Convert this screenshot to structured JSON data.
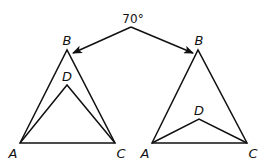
{
  "diagram": {
    "angle_label": "70°",
    "left_figure": {
      "points": {
        "A": {
          "label": "A",
          "x": 20,
          "y": 143
        },
        "B": {
          "label": "B",
          "x": 67,
          "y": 50
        },
        "C": {
          "label": "C",
          "x": 115,
          "y": 143
        },
        "D": {
          "label": "D",
          "x": 67,
          "y": 85
        }
      }
    },
    "right_figure": {
      "points": {
        "A": {
          "label": "A",
          "x": 152,
          "y": 143
        },
        "B": {
          "label": "B",
          "x": 198,
          "y": 50
        },
        "C": {
          "label": "C",
          "x": 247,
          "y": 143
        },
        "D": {
          "label": "D",
          "x": 199,
          "y": 119
        }
      }
    },
    "arrows": {
      "origin": {
        "x": 131,
        "y": 27
      },
      "left_target": {
        "x": 73,
        "y": 53
      },
      "right_target": {
        "x": 193,
        "y": 53
      }
    },
    "colors": {
      "stroke": "#111111",
      "background": "#ffffff"
    }
  }
}
